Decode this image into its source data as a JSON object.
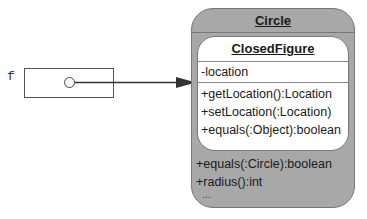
{
  "variable": {
    "name": "f"
  },
  "outer_class": {
    "name": "Circle",
    "operations": [
      "+equals(:Circle):boolean",
      "+radius():int",
      "..."
    ],
    "fill_color": "#a8a8a8"
  },
  "inner_class": {
    "name": "ClosedFigure",
    "attributes": [
      "-location"
    ],
    "operations": [
      "+getLocation():Location",
      "+setLocation(:Location)",
      "+equals(:Object):boolean"
    ],
    "fill_color": "#ffffff"
  }
}
